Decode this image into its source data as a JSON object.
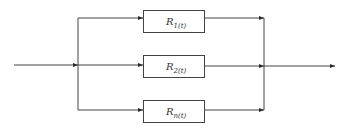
{
  "diagram": {
    "type": "parallel reliability block diagram",
    "colors": {
      "line": "#3a3a3a",
      "background": "#ffffff"
    },
    "blocks": [
      {
        "base": "R",
        "sub": "1(t)"
      },
      {
        "base": "R",
        "sub": "2(t)"
      },
      {
        "base": "R",
        "sub": "n(t)"
      }
    ]
  }
}
